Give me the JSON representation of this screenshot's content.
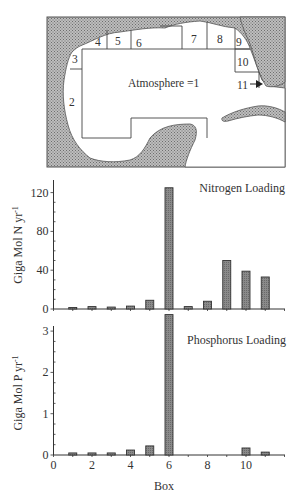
{
  "map": {
    "atmosphere_label": "Atmosphere =1",
    "box_labels": [
      "2",
      "3",
      "4",
      "5",
      "6",
      "7",
      "8",
      "9",
      "10",
      "11"
    ],
    "colors": {
      "land": "#9a9a9a",
      "water": "#ffffff",
      "border": "#444444"
    }
  },
  "chart_data": [
    {
      "type": "bar",
      "title": "Nitrogen Loading",
      "xlabel": "Box",
      "ylabel": "Giga Mol N yr-1",
      "ylabel_base": "Giga Mol N yr",
      "ylabel_sup": "-1",
      "categories": [
        1,
        2,
        3,
        4,
        5,
        6,
        7,
        8,
        9,
        10,
        11
      ],
      "values": [
        1,
        2.5,
        2,
        3,
        9,
        125,
        2.5,
        8,
        50,
        39,
        33
      ],
      "ylim": [
        0,
        130
      ],
      "yticks": [
        0,
        40,
        80,
        120
      ],
      "xlim": [
        0,
        12
      ],
      "grid": false,
      "bar_color": "#7a7a7a"
    },
    {
      "type": "bar",
      "title": "Phosphorus Loading",
      "xlabel": "Box",
      "ylabel": "Giga Mol P yr-1",
      "ylabel_base": "Giga Mol P yr",
      "ylabel_sup": "-1",
      "categories": [
        1,
        2,
        3,
        4,
        5,
        6,
        7,
        8,
        9,
        10,
        11
      ],
      "values": [
        0.05,
        0.05,
        0.05,
        0.12,
        0.22,
        3.4,
        0,
        0,
        0,
        0.17,
        0.07
      ],
      "ylim": [
        0,
        3.3
      ],
      "yticks": [
        0,
        1,
        2,
        3
      ],
      "xticks": [
        0,
        2,
        4,
        6,
        8,
        10
      ],
      "xlim": [
        0,
        12
      ],
      "grid": false,
      "bar_color": "#7a7a7a"
    }
  ]
}
